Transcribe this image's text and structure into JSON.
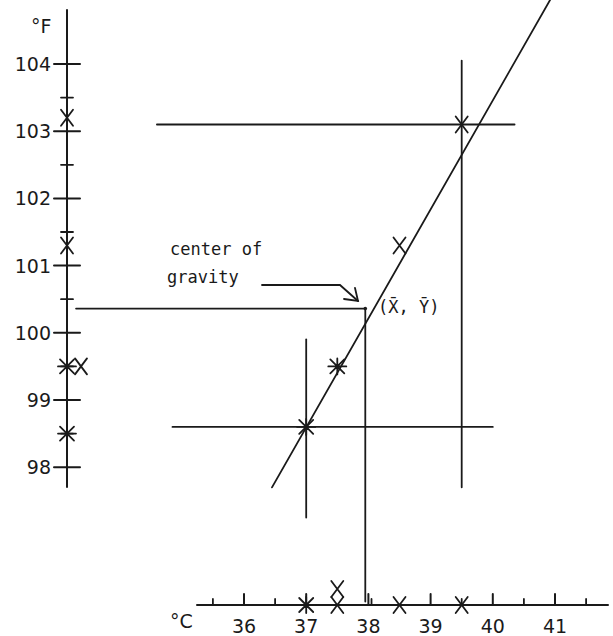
{
  "chart_data": {
    "type": "scatter",
    "title": "",
    "xlabel": "°C",
    "ylabel": "°F",
    "xlim": [
      35.5,
      41.5
    ],
    "ylim": [
      98,
      104
    ],
    "x_ticks": [
      "36",
      "37",
      "38",
      "39",
      "40",
      "41"
    ],
    "y_ticks": [
      "98",
      "99",
      "100",
      "101",
      "102",
      "103",
      "104"
    ],
    "grid": false,
    "points": [
      {
        "x": 37.0,
        "y": 98.6,
        "marker": "star"
      },
      {
        "x": 37.5,
        "y": 99.5,
        "marker": "star"
      },
      {
        "x": 38.5,
        "y": 101.3,
        "marker": "x"
      },
      {
        "x": 39.5,
        "y": 103.1,
        "marker": "x"
      }
    ],
    "x_marginal_marks": [
      {
        "x": 37.0,
        "marker": "star"
      },
      {
        "x": 37.5,
        "marker": "x",
        "stack": 2
      },
      {
        "x": 38.5,
        "marker": "x"
      },
      {
        "x": 39.5,
        "marker": "x"
      }
    ],
    "y_marginal_marks": [
      {
        "y": 103.2,
        "marker": "x"
      },
      {
        "y": 101.3,
        "marker": "x"
      },
      {
        "y": 99.5,
        "marker": "star"
      },
      {
        "y": 99.5,
        "marker": "x",
        "offset": true
      },
      {
        "y": 98.5,
        "marker": "star"
      }
    ],
    "regression_line": {
      "x_start": 36.45,
      "y_start": 97.7,
      "x_end": 40.95,
      "y_end": 105.0
    },
    "center_of_gravity": {
      "x": 37.95,
      "y": 100.36,
      "label": "(X̄, Ȳ)"
    },
    "reference_lines": [
      {
        "orientation": "horizontal",
        "y": 103.1,
        "x_from": 34.6,
        "x_to": 40.35
      },
      {
        "orientation": "vertical",
        "x": 39.5,
        "y_from": 97.7,
        "y_to": 104.05
      },
      {
        "orientation": "horizontal",
        "y": 98.6,
        "x_from": 34.85,
        "x_to": 40.0
      },
      {
        "orientation": "vertical",
        "x": 37.0,
        "y_from": 97.25,
        "y_to": 99.9
      },
      {
        "orientation": "horizontal",
        "y": 100.36,
        "x_from": 33.3,
        "x_to": 37.95
      },
      {
        "orientation": "vertical",
        "x": 37.95,
        "y_from": 96.0,
        "y_to": 100.36
      }
    ],
    "annotations": [
      {
        "text_line1": "center of",
        "text_line2": "gravity",
        "points_to": "center_of_gravity"
      }
    ]
  }
}
